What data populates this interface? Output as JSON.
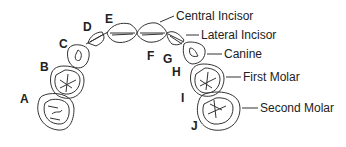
{
  "diagram": {
    "stroke_color": "#333333",
    "letters": [
      {
        "id": "A",
        "x": 20,
        "y": 93
      },
      {
        "id": "B",
        "x": 40,
        "y": 61
      },
      {
        "id": "C",
        "x": 59,
        "y": 38
      },
      {
        "id": "D",
        "x": 83,
        "y": 21
      },
      {
        "id": "E",
        "x": 105,
        "y": 13
      },
      {
        "id": "F",
        "x": 147,
        "y": 50
      },
      {
        "id": "G",
        "x": 163,
        "y": 53
      },
      {
        "id": "H",
        "x": 172,
        "y": 66
      },
      {
        "id": "I",
        "x": 181,
        "y": 92
      },
      {
        "id": "J",
        "x": 191,
        "y": 120
      }
    ],
    "labels": [
      {
        "text": "Central Incisor",
        "x": 176,
        "y": 10
      },
      {
        "text": "Lateral Incisor",
        "x": 201,
        "y": 29
      },
      {
        "text": "Canine",
        "x": 224,
        "y": 48
      },
      {
        "text": "First Molar",
        "x": 243,
        "y": 71
      },
      {
        "text": "Second Molar",
        "x": 260,
        "y": 102
      }
    ]
  }
}
